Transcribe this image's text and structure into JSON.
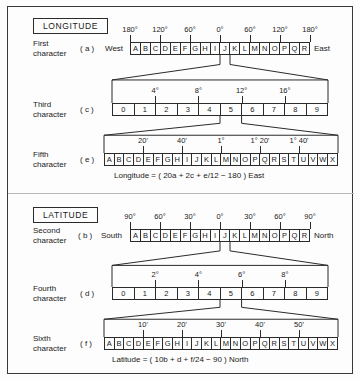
{
  "longitude": {
    "section_label": "LONGITUDE",
    "rows": [
      {
        "label_line1": "First",
        "label_line2": "character",
        "key": "( a )",
        "left_side": "West",
        "right_side": "East",
        "cells": [
          "A",
          "B",
          "C",
          "D",
          "E",
          "F",
          "G",
          "H",
          "I",
          "J",
          "K",
          "L",
          "M",
          "N",
          "O",
          "P",
          "Q",
          "R"
        ],
        "ticks": [
          {
            "label": "180°",
            "index": 0
          },
          {
            "label": "120°",
            "index": 3
          },
          {
            "label": "60°",
            "index": 6
          },
          {
            "label": "0°",
            "index": 9
          },
          {
            "label": "60°",
            "index": 12
          },
          {
            "label": "120°",
            "index": 15
          },
          {
            "label": "180°",
            "index": 18
          }
        ]
      },
      {
        "label_line1": "Third",
        "label_line2": "character",
        "key": "( c )",
        "left_side": "",
        "right_side": "",
        "cells": [
          "0",
          "1",
          "2",
          "3",
          "4",
          "5",
          "6",
          "7",
          "8",
          "9"
        ],
        "ticks": [
          {
            "label": "4°",
            "index": 2
          },
          {
            "label": "8°",
            "index": 4
          },
          {
            "label": "12°",
            "index": 6
          },
          {
            "label": "16°",
            "index": 8
          }
        ]
      },
      {
        "label_line1": "Fifth",
        "label_line2": "character",
        "key": "( e )",
        "left_side": "",
        "right_side": "",
        "cells": [
          "A",
          "B",
          "C",
          "D",
          "E",
          "F",
          "G",
          "H",
          "I",
          "J",
          "K",
          "L",
          "M",
          "N",
          "O",
          "P",
          "Q",
          "R",
          "S",
          "T",
          "U",
          "V",
          "W",
          "X"
        ],
        "ticks": [
          {
            "label": "20'",
            "index": 4
          },
          {
            "label": "40'",
            "index": 8
          },
          {
            "label": "1°",
            "index": 12
          },
          {
            "label": "1° 20'",
            "index": 16
          },
          {
            "label": "1° 40'",
            "index": 20
          }
        ]
      }
    ],
    "formula": "Longitude = ( 20a + 2c + e/12 − 180 )  East"
  },
  "latitude": {
    "section_label": "LATITUDE",
    "rows": [
      {
        "label_line1": "Second",
        "label_line2": "character",
        "key": "( b )",
        "left_side": "South",
        "right_side": "North",
        "cells": [
          "A",
          "B",
          "C",
          "D",
          "E",
          "F",
          "G",
          "H",
          "I",
          "J",
          "K",
          "L",
          "M",
          "N",
          "O",
          "P",
          "Q",
          "R"
        ],
        "ticks": [
          {
            "label": "90°",
            "index": 0
          },
          {
            "label": "60°",
            "index": 3
          },
          {
            "label": "30°",
            "index": 6
          },
          {
            "label": "0°",
            "index": 9
          },
          {
            "label": "30°",
            "index": 12
          },
          {
            "label": "60°",
            "index": 15
          },
          {
            "label": "90°",
            "index": 18
          }
        ]
      },
      {
        "label_line1": "Fourth",
        "label_line2": "character",
        "key": "( d )",
        "left_side": "",
        "right_side": "",
        "cells": [
          "0",
          "1",
          "2",
          "3",
          "4",
          "5",
          "6",
          "7",
          "8",
          "9"
        ],
        "ticks": [
          {
            "label": "2°",
            "index": 2
          },
          {
            "label": "4°",
            "index": 4
          },
          {
            "label": "6°",
            "index": 6
          },
          {
            "label": "8°",
            "index": 8
          }
        ]
      },
      {
        "label_line1": "Sixth",
        "label_line2": "character",
        "key": "( f )",
        "left_side": "",
        "right_side": "",
        "cells": [
          "A",
          "B",
          "C",
          "D",
          "E",
          "F",
          "G",
          "H",
          "I",
          "J",
          "K",
          "L",
          "M",
          "N",
          "O",
          "P",
          "Q",
          "R",
          "S",
          "T",
          "U",
          "V",
          "W",
          "X"
        ],
        "ticks": [
          {
            "label": "10'",
            "index": 4
          },
          {
            "label": "20'",
            "index": 8
          },
          {
            "label": "30'",
            "index": 12
          },
          {
            "label": "40'",
            "index": 16
          },
          {
            "label": "50'",
            "index": 20
          }
        ]
      }
    ],
    "formula": "Latitude = ( 10b + d + f/24 − 90 )  North"
  },
  "colors": {
    "line": "#2b2b2b",
    "background": "#fdfdfd",
    "text": "#1a1a1a"
  }
}
